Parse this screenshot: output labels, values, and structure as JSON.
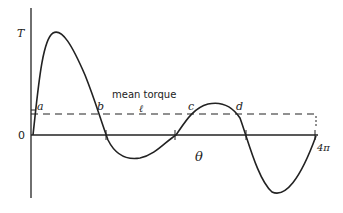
{
  "diagram": {
    "y_axis_label": "T",
    "x_axis_label": "θ",
    "origin_label": "0",
    "x_end_label": "4π",
    "mean_line_label": "mean torque",
    "mean_line_marker": "ℓ",
    "points": [
      "a",
      "b",
      "c",
      "d"
    ],
    "ink_color": "#222222"
  }
}
